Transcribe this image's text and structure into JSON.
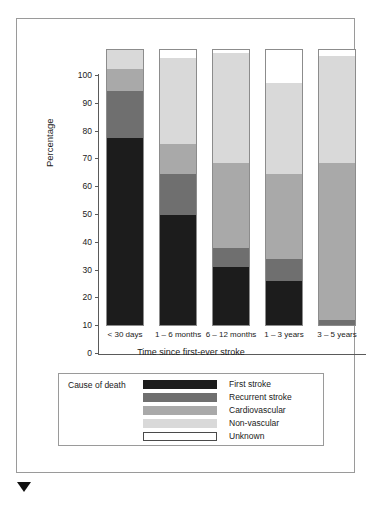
{
  "axes": {
    "ylabel": "Percentage",
    "xlabel": "Time since first-ever stroke",
    "yticks": [
      "100",
      "90",
      "80",
      "70",
      "60",
      "50",
      "40",
      "30",
      "20",
      "10",
      "0"
    ]
  },
  "legend": {
    "title": "Cause of death",
    "entries": [
      {
        "label": "First stroke",
        "color": "#1c1c1c"
      },
      {
        "label": "Recurrent stroke",
        "color": "#6f6f6f"
      },
      {
        "label": "Cardiovascular",
        "color": "#a9a9a9"
      },
      {
        "label": "Non-vascular",
        "color": "#d9d9d9"
      },
      {
        "label": "Unknown",
        "color": "#ffffff"
      }
    ]
  },
  "chart_data": {
    "type": "bar",
    "stacked": true,
    "title": "",
    "xlabel": "Time since first-ever stroke",
    "ylabel": "Percentage",
    "ylim": [
      0,
      100
    ],
    "grid": false,
    "legend_position": "bottom",
    "categories": [
      "< 30 days",
      "1 – 6 months",
      "6 – 12 months",
      "1 – 3 years",
      "3 – 5 years"
    ],
    "series": [
      {
        "name": "First stroke",
        "color": "#1c1c1c",
        "values": [
          68,
          40,
          21,
          16,
          0
        ]
      },
      {
        "name": "Recurrent stroke",
        "color": "#6f6f6f",
        "values": [
          17,
          15,
          7,
          8,
          2
        ]
      },
      {
        "name": "Cardiovascular",
        "color": "#a9a9a9",
        "values": [
          8,
          11,
          31,
          31,
          57
        ]
      },
      {
        "name": "Non-vascular",
        "color": "#d9d9d9",
        "values": [
          7,
          31,
          40,
          33,
          39
        ]
      },
      {
        "name": "Unknown",
        "color": "#ffffff",
        "values": [
          0,
          3,
          1,
          12,
          2
        ]
      }
    ]
  }
}
